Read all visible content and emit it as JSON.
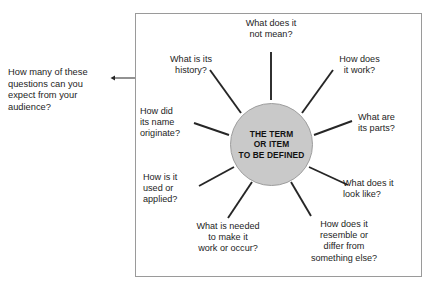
{
  "annotation": {
    "text": "How many of these\nquestions can you\nexpect from your\naudience?",
    "arrow_icon": "double-headed-arrow-icon"
  },
  "diagram": {
    "type": "radial-spoke-diagram",
    "hub_label": "THE TERM\nOR ITEM\nTO BE DEFINED",
    "hub_fill_color": "#c9c9c9",
    "hub_border_color": "#9d9d9d",
    "frame_border_color": "#9a9a9a",
    "spoke_color": "#262626",
    "spokes": [
      {
        "id": "not-mean",
        "label": "What does it\nnot mean?"
      },
      {
        "id": "history",
        "label": "What is its\nhistory?"
      },
      {
        "id": "how-works",
        "label": "How does\nit work?"
      },
      {
        "id": "name-origin",
        "label": "How did\nits name\noriginate?"
      },
      {
        "id": "parts",
        "label": "What are\nits parts?"
      },
      {
        "id": "used",
        "label": "How is it\nused or\napplied?"
      },
      {
        "id": "look-like",
        "label": "What does it\nlook like?"
      },
      {
        "id": "needed",
        "label": "What is needed\nto make it\nwork or occur?"
      },
      {
        "id": "resemble",
        "label": "How does it\nresemble or\ndiffer from\nsomething else?"
      }
    ]
  }
}
